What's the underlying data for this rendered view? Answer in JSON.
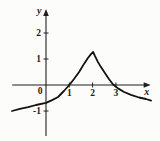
{
  "figure": {
    "background": "#fcfcfa",
    "axis_color": "#1f1f1f",
    "curve_color": "#121212",
    "label_color": "#1c1c1c"
  },
  "chart_data": {
    "type": "line",
    "title": "",
    "xlabel": "x",
    "ylabel": "y",
    "origin_label": "0",
    "x_ticks": [
      1,
      2,
      3
    ],
    "y_ticks": [
      -1,
      1,
      2
    ],
    "xlim": [
      -1.45,
      4.45
    ],
    "ylim": [
      -1.96,
      2.88
    ],
    "grid": false,
    "legend": null,
    "cusp_point": [
      2,
      1
    ],
    "x_intercepts": [
      1,
      3
    ],
    "curve_points": [
      [
        -1.46,
        -1.0
      ],
      [
        -1.12,
        -0.92
      ],
      [
        -0.77,
        -0.85
      ],
      [
        -0.43,
        -0.77
      ],
      [
        0.0,
        -0.69
      ],
      [
        0.26,
        -0.58
      ],
      [
        0.52,
        -0.46
      ],
      [
        0.77,
        -0.23
      ],
      [
        1.0,
        0.0
      ],
      [
        1.2,
        0.23
      ],
      [
        1.42,
        0.5
      ],
      [
        1.63,
        0.81
      ],
      [
        1.8,
        1.04
      ],
      [
        1.93,
        1.19
      ],
      [
        2.02,
        1.27
      ],
      [
        2.1,
        1.12
      ],
      [
        2.23,
        0.88
      ],
      [
        2.36,
        0.69
      ],
      [
        2.53,
        0.46
      ],
      [
        2.7,
        0.23
      ],
      [
        2.88,
        0.02
      ],
      [
        3.09,
        -0.13
      ],
      [
        3.35,
        -0.27
      ],
      [
        3.65,
        -0.38
      ],
      [
        3.99,
        -0.48
      ],
      [
        4.29,
        -0.54
      ],
      [
        4.51,
        -0.6
      ]
    ]
  }
}
